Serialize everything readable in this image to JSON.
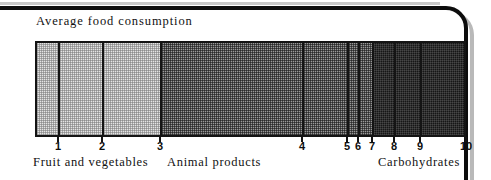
{
  "chart_data": {
    "type": "bar",
    "orientation": "horizontal-stacked",
    "title": "Average food consumption",
    "xlabel": "",
    "ylabel": "",
    "grid": false,
    "legend_position": "below-axis",
    "axis": {
      "tick_labels": [
        "1",
        "2",
        "3",
        "4",
        "5",
        "6",
        "7",
        "8",
        "9",
        "10"
      ],
      "tick_positions_px": [
        58,
        102,
        160,
        302,
        347,
        358,
        372,
        394,
        420,
        466
      ],
      "range_px": [
        35,
        466
      ]
    },
    "groups": [
      {
        "label": "Fruit and vegetables",
        "shade": "light",
        "segments": [
          1,
          2,
          3
        ]
      },
      {
        "label": "Animal products",
        "shade": "medium",
        "segments": [
          4,
          5,
          6,
          7
        ]
      },
      {
        "label": "Carbohydrates",
        "shade": "dark",
        "segments": [
          8,
          9,
          10
        ]
      }
    ],
    "categories": [
      "1",
      "2",
      "3",
      "4",
      "5",
      "6",
      "7",
      "8",
      "9",
      "10"
    ],
    "values": [
      23,
      44,
      58,
      142,
      45,
      11,
      14,
      22,
      26,
      46
    ],
    "segment_shades": [
      "light",
      "light",
      "light",
      "medium",
      "medium",
      "medium",
      "medium",
      "dark",
      "dark",
      "dark"
    ]
  },
  "segments": [
    {
      "id": "1",
      "shade": "light",
      "left": 35,
      "width": 23
    },
    {
      "id": "2",
      "shade": "light",
      "left": 58,
      "width": 44
    },
    {
      "id": "3",
      "shade": "light",
      "left": 102,
      "width": 58
    },
    {
      "id": "4",
      "shade": "medium",
      "left": 160,
      "width": 142
    },
    {
      "id": "5",
      "shade": "medium",
      "left": 302,
      "width": 45
    },
    {
      "id": "6",
      "shade": "medium",
      "left": 347,
      "width": 11
    },
    {
      "id": "7",
      "shade": "medium",
      "left": 358,
      "width": 14
    },
    {
      "id": "8",
      "shade": "dark",
      "left": 372,
      "width": 22
    },
    {
      "id": "9",
      "shade": "dark",
      "left": 394,
      "width": 26
    },
    {
      "id": "10",
      "shade": "dark",
      "left": 420,
      "width": 46
    }
  ],
  "ticks": [
    {
      "label": "1",
      "x": 58
    },
    {
      "label": "2",
      "x": 102
    },
    {
      "label": "3",
      "x": 160
    },
    {
      "label": "4",
      "x": 302
    },
    {
      "label": "5",
      "x": 347
    },
    {
      "label": "6",
      "x": 358
    },
    {
      "label": "7",
      "x": 372
    },
    {
      "label": "8",
      "x": 394
    },
    {
      "label": "9",
      "x": 420
    },
    {
      "label": "10",
      "x": 466
    }
  ],
  "group_labels": [
    {
      "text": "Fruit and vegetables",
      "x": 33
    },
    {
      "text": "Animal products",
      "x": 167
    },
    {
      "text": "Carbohydrates",
      "x": 378
    }
  ],
  "colors": {
    "ink": "#141414",
    "light_fill": "#e4e4e4",
    "medium_fill": "#9a9a9a",
    "dark_fill": "#161616",
    "page": "#ffffff"
  }
}
